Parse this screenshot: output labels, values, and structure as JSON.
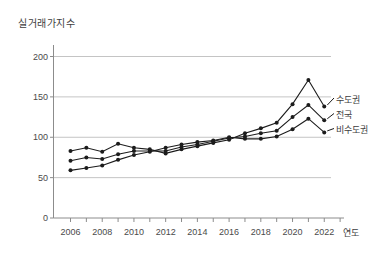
{
  "title": "실거래가지수",
  "x_axis_label": "연도",
  "chart_data": {
    "type": "line",
    "title": "실거래가지수",
    "xlabel": "연도",
    "ylabel": "",
    "x": [
      2006,
      2007,
      2008,
      2009,
      2010,
      2011,
      2012,
      2013,
      2014,
      2015,
      2016,
      2017,
      2018,
      2019,
      2020,
      2021,
      2022
    ],
    "series": [
      {
        "name": "수도권",
        "values": [
          83,
          87,
          82,
          92,
          87,
          85,
          80,
          85,
          89,
          93,
          97,
          105,
          111,
          118,
          141,
          171,
          138
        ]
      },
      {
        "name": "전국",
        "values": [
          71,
          75,
          73,
          79,
          83,
          83,
          83,
          88,
          91,
          95,
          99,
          101,
          105,
          108,
          125,
          140,
          121
        ]
      },
      {
        "name": "비수도권",
        "values": [
          59,
          62,
          65,
          72,
          78,
          82,
          87,
          91,
          94,
          96,
          100,
          98,
          98,
          101,
          110,
          123,
          106
        ]
      }
    ],
    "ylim": [
      0,
      200
    ],
    "yticks": [
      0,
      50,
      100,
      150,
      200
    ],
    "xticks": [
      2006,
      2008,
      2010,
      2012,
      2014,
      2016,
      2018,
      2020,
      2022
    ],
    "grid": true,
    "legend_position": "right-of-line-ends",
    "line_color": "#1c1c1c",
    "marker": "dot",
    "grid_color": "#b5b5b5",
    "axis_color": "#8c8c8c",
    "text_color": "#4a4a4a"
  }
}
